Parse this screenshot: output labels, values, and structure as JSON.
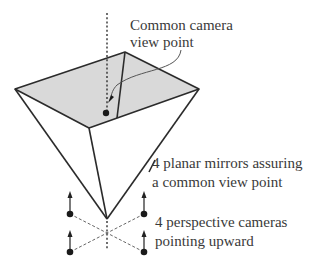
{
  "diagram": {
    "labels": {
      "viewpoint_line1": "Common camera",
      "viewpoint_line2": "view point",
      "mirrors_line1": "4 planar mirrors assuring",
      "mirrors_line2": "a common view point",
      "cameras_line1": "4 perspective cameras",
      "cameras_line2": "pointing upward"
    },
    "components": {
      "mirror_count": 4,
      "camera_count": 4
    },
    "colors": {
      "mirror_top_face": "#d9d9d9",
      "lines": "#2b2b2b",
      "text": "#3a3a3a"
    }
  }
}
